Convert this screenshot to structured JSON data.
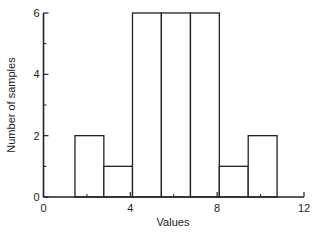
{
  "chart_data": {
    "type": "bar",
    "subtype": "histogram",
    "title": "",
    "xlabel": "Values",
    "ylabel": "Number of samples",
    "xlim": [
      0,
      12
    ],
    "ylim": [
      0,
      6
    ],
    "xticks": [
      0,
      4,
      8,
      12
    ],
    "xminor_ticks": [
      2,
      6,
      10
    ],
    "yticks": [
      0,
      2,
      4,
      6
    ],
    "yminor_ticks": [
      1,
      3,
      5
    ],
    "grid": false,
    "legend": null,
    "bins": [
      {
        "start": 1.45,
        "end": 2.78,
        "count": 2
      },
      {
        "start": 2.78,
        "end": 4.1,
        "count": 1
      },
      {
        "start": 4.1,
        "end": 5.43,
        "count": 6
      },
      {
        "start": 5.43,
        "end": 6.77,
        "count": 6
      },
      {
        "start": 6.77,
        "end": 8.1,
        "count": 6
      },
      {
        "start": 8.1,
        "end": 9.43,
        "count": 1
      },
      {
        "start": 9.43,
        "end": 10.76,
        "count": 2
      }
    ],
    "categories": [
      "1.45-2.78",
      "2.78-4.1",
      "4.1-5.43",
      "5.43-6.77",
      "6.77-8.1",
      "8.1-9.43",
      "9.43-10.76"
    ],
    "values": [
      2,
      1,
      6,
      6,
      6,
      1,
      2
    ]
  },
  "labels": {
    "xlabel": "Values",
    "ylabel": "Number of samples",
    "xticks": [
      "0",
      "4",
      "8",
      "12"
    ],
    "yticks": [
      "0",
      "2",
      "4",
      "6"
    ]
  }
}
